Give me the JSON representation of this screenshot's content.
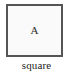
{
  "figure": {
    "background_color": "#ffffff",
    "shape": {
      "kind": "square",
      "interior_label": "A",
      "fill_color": "#fafafa",
      "stroke_color": "#555555",
      "stroke_width_px": 2
    },
    "caption": {
      "text": "square",
      "color": "#1e1e1e"
    }
  }
}
